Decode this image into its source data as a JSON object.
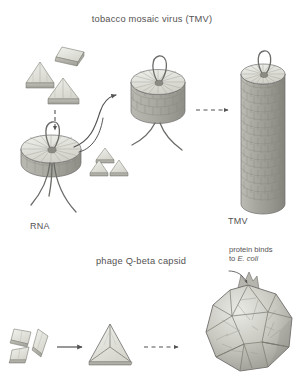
{
  "figure": {
    "background_color": "#ffffff",
    "ink_color": "#555253",
    "panels": [
      {
        "id": "tmv",
        "title": "tobacco mosaic virus (TMV)",
        "labels": [
          "RNA",
          "TMV"
        ]
      },
      {
        "id": "qbeta",
        "title": "phage Q-beta capsid",
        "annotation_line1": "protein binds",
        "annotation_line2_prefix": "to ",
        "annotation_line2_species": "E. coli"
      }
    ]
  },
  "panel_tmv": {
    "title": "tobacco mosaic virus (TMV)",
    "rna_label": "RNA",
    "product_label": "TMV",
    "subunits_name": "coat protein subunits",
    "disc_name": "protein disc",
    "stack_name": "stacked disc helix",
    "rod_name": "assembled TMV rod"
  },
  "panel_qbeta": {
    "title": "phage Q-beta capsid",
    "annotation": {
      "line1": "protein binds",
      "line2_prefix": "to ",
      "line2_species": "E. coli"
    },
    "subunits_name": "capsid protein subunits",
    "trimer_name": "protein trimer",
    "capsid_name": "icosahedral capsid"
  },
  "colors": {
    "ink": "#555253",
    "outline": "#6e6c6b",
    "protein_light": "#e8e8e4",
    "protein_mid": "#c9c9c2",
    "protein_dark": "#a3a39b",
    "shell_shadow": "#8d8d85",
    "rna_strand": "#6b6b68"
  }
}
